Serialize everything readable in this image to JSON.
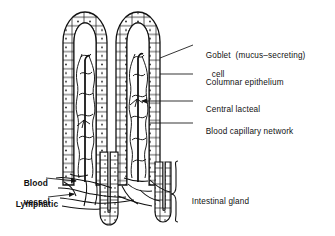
{
  "figure": {
    "type": "biological-diagram",
    "background_color": "#ffffff",
    "ink_color": "#111111",
    "labels": [
      {
        "id": "goblet-cell",
        "line1": "Goblet  (mucus–secreting)",
        "line2": "cell",
        "x": 196,
        "y": 44,
        "leader": "diagonal",
        "target": "villus epithelium wall"
      },
      {
        "id": "columnar-epithelium",
        "line1": "Columnar epithelium",
        "x": 196,
        "y": 71,
        "leader": "horizontal",
        "target": "villus epithelium wall"
      },
      {
        "id": "central-lacteal",
        "line1": "Central lacteal",
        "x": 196,
        "y": 98,
        "leader": "horizontal-arrow",
        "target": "villus core lacteal"
      },
      {
        "id": "blood-capillary-network",
        "line1": "Blood capillary network",
        "x": 196,
        "y": 120,
        "leader": "horizontal",
        "target": "villus core capillaries"
      },
      {
        "id": "blood-vessel",
        "line1": "Blood",
        "line2": "vessel",
        "x": 14,
        "y": 172,
        "leader": "horizontal-arrow",
        "target": "submucosal blood vessel",
        "bold": true
      },
      {
        "id": "lymphatic",
        "line1": "Lymphatic",
        "x": 10,
        "y": 194,
        "leader": "horizontal-arrow",
        "target": "submucosal lymphatic",
        "bold": true
      },
      {
        "id": "intestinal-gland",
        "line1": "Intestinal gland",
        "x": 181,
        "y": 190,
        "leader": "bracket",
        "target": "crypt of Lieberkuhn"
      }
    ],
    "structures": [
      {
        "id": "villus-left",
        "label": "left intestinal villus",
        "x_range": [
          62,
          108
        ],
        "y_range": [
          10,
          185
        ]
      },
      {
        "id": "villus-right",
        "label": "right intestinal villus",
        "x_range": [
          115,
          163
        ],
        "y_range": [
          10,
          185
        ]
      },
      {
        "id": "gland-center",
        "label": "intestinal gland (centre)",
        "x_range": [
          100,
          118
        ],
        "y_range": [
          150,
          230
        ]
      },
      {
        "id": "gland-right",
        "label": "intestinal gland (right)",
        "x_range": [
          155,
          172
        ],
        "y_range": [
          160,
          228
        ]
      },
      {
        "id": "vessel-network",
        "label": "submucosal vessel and lymphatic network",
        "x_range": [
          55,
          180
        ],
        "y_range": [
          168,
          215
        ]
      }
    ]
  }
}
